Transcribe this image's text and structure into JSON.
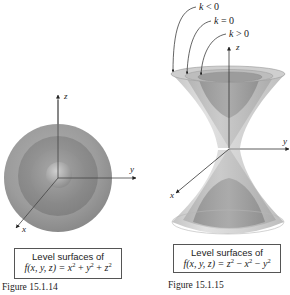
{
  "figures": [
    {
      "id": "15.1.14",
      "label": "Figure 15.1.14",
      "caption_title": "Level surfaces of",
      "caption_formula_prefix": "f(x, y, z) = ",
      "caption_formula_terms": [
        "x",
        "2",
        " + ",
        "y",
        "2",
        " + ",
        "z",
        "2"
      ],
      "axes": {
        "x": "x",
        "y": "y",
        "z": "z"
      },
      "surface_type": "concentric spheres"
    },
    {
      "id": "15.1.15",
      "label": "Figure 15.1.15",
      "caption_title": "Level surfaces of",
      "caption_formula_prefix": "f(x, y, z) = ",
      "caption_formula_terms": [
        "z",
        "2",
        " − ",
        "x",
        "2",
        " − ",
        "y",
        "2"
      ],
      "axes": {
        "x": "x",
        "y": "y",
        "z": "z"
      },
      "surface_type": "hyperboloids and cone",
      "annotations": [
        {
          "text_var": "k",
          "relation": " < 0"
        },
        {
          "text_var": "k",
          "relation": " = 0"
        },
        {
          "text_var": "k",
          "relation": " > 0"
        }
      ]
    }
  ],
  "colors": {
    "sphere_outer": "#9a9a9a",
    "sphere_mid": "#8c8c8c",
    "sphere_inner": "#a5a5a5",
    "cone_light": "#d6d6d6",
    "cone_mid": "#bcbcbc",
    "cone_dark": "#8e8e8e",
    "axis": "#333333",
    "caption_border": "#555555"
  }
}
